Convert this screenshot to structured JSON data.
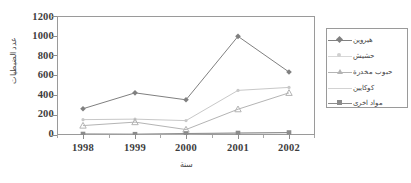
{
  "chart_data": {
    "type": "line",
    "title": "",
    "subtitle": "",
    "xlabel": "سنة",
    "ylabel": "عدد الضبطيات",
    "categories": [
      "1998",
      "1999",
      "2000",
      "2001",
      "2002"
    ],
    "x": [
      1998,
      1999,
      2000,
      2001,
      2002
    ],
    "ylim": [
      0,
      1200
    ],
    "yticks": [
      0,
      200,
      400,
      600,
      800,
      1000,
      1200
    ],
    "ytick_labels": [
      "0",
      "200",
      "400",
      "600",
      "800",
      "1000",
      "1200"
    ],
    "grid": false,
    "legend_position": "right",
    "series": [
      {
        "name": "هيروين",
        "marker": "diamond",
        "color": "#808080",
        "values": [
          265,
          425,
          355,
          995,
          635
        ]
      },
      {
        "name": "حشيش",
        "marker": "none",
        "color": "#c8c8c8",
        "values": [
          155,
          160,
          145,
          450,
          480
        ]
      },
      {
        "name": "حبوب مخدرة",
        "marker": "triangle",
        "color": "#b4b4b4",
        "values": [
          95,
          130,
          55,
          260,
          425
        ]
      },
      {
        "name": "كوكايين",
        "marker": "none",
        "color": "#d2d2d2",
        "values": [
          10,
          8,
          12,
          18,
          22
        ]
      },
      {
        "name": "مواد اخرى",
        "marker": "square",
        "color": "#8c8c8c",
        "values": [
          10,
          8,
          15,
          20,
          25
        ]
      }
    ],
    "axis_color": "#9a9a9a",
    "background": "#ffffff"
  },
  "legend": {
    "entries": [
      {
        "label": "هيروين"
      },
      {
        "label": "حشيش"
      },
      {
        "label": "حبوب مخدرة"
      },
      {
        "label": "كوكايين"
      },
      {
        "label": "مواد اخرى"
      }
    ]
  },
  "axes": {
    "y_title": "عدد الضبطيات",
    "x_title": "سنة",
    "y_ticks": [
      "1200",
      "1000",
      "800",
      "600",
      "400",
      "200",
      "0"
    ],
    "x_ticks": [
      "1998",
      "1999",
      "2000",
      "2001",
      "2002"
    ]
  }
}
